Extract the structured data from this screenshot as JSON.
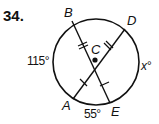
{
  "problem": {
    "number": "34."
  },
  "diagram": {
    "points": {
      "B": "B",
      "D": "D",
      "C": "C",
      "A": "A",
      "E": "E"
    },
    "arcs": {
      "left": "115°",
      "bottom": "55°",
      "right": "x°"
    },
    "colors": {
      "stroke": "#111111",
      "background": "#ffffff"
    }
  }
}
